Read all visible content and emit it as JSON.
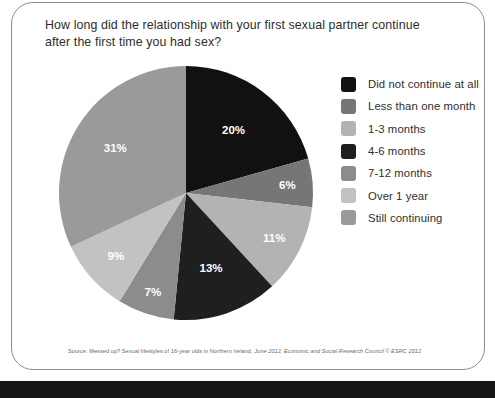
{
  "card": {
    "question": "How long did the relationship with your first sexual partner continue after the first time you had sex?",
    "source_prefix": "Source: Messed up? Sexual lifestyles of 16-year olds in Northern Ireland, ",
    "source_italic": "June 2012, Economic and Social Research Council © ESRC 2012"
  },
  "chart_data": {
    "type": "pie",
    "title": "How long did the relationship with your first sexual partner continue after the first time you had sex?",
    "categories": [
      "Did not continue at all",
      "Less than one month",
      "1-3 months",
      "4-6 months",
      "7-12 months",
      "Over 1 year",
      "Still continuing"
    ],
    "values": [
      20,
      6,
      11,
      13,
      7,
      9,
      31
    ],
    "labels": [
      "20%",
      "6%",
      "11%",
      "13%",
      "7%",
      "9%",
      "31%"
    ],
    "colors": [
      "#111111",
      "#767676",
      "#b3b3b3",
      "#1f1f1f",
      "#8c8c8c",
      "#c2c2c2",
      "#9a9a9a"
    ],
    "unit": "%",
    "legend_position": "right",
    "start_angle": 0,
    "direction": "clockwise",
    "grid": false,
    "xlabel": "",
    "ylabel": ""
  },
  "legend": {
    "items": [
      {
        "label": "Did not continue at all",
        "color": "#111111"
      },
      {
        "label": "Less than one month",
        "color": "#767676"
      },
      {
        "label": "1-3 months",
        "color": "#b3b3b3"
      },
      {
        "label": "4-6 months",
        "color": "#1f1f1f"
      },
      {
        "label": "7-12 months",
        "color": "#8c8c8c"
      },
      {
        "label": "Over 1 year",
        "color": "#c2c2c2"
      },
      {
        "label": "Still continuing",
        "color": "#9a9a9a"
      }
    ]
  }
}
